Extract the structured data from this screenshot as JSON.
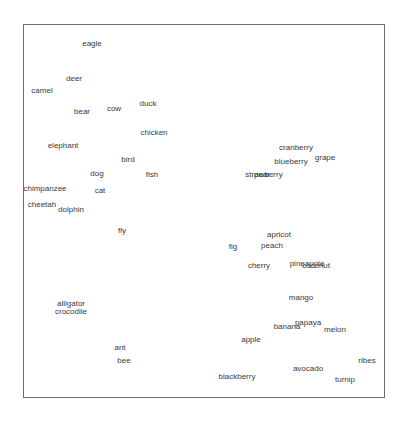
{
  "chart_data": {
    "type": "scatter",
    "title": "",
    "xlabel": "",
    "ylabel": "",
    "grid": false,
    "legend": null,
    "frame": {
      "left": 23,
      "top": 24,
      "right": 385,
      "bottom": 398
    },
    "style": {
      "text_color": "#3a3a3a",
      "frame_color": "#6e6e6e",
      "background": "#ffffff"
    },
    "note": "Text-label scatter (2D embedding); coordinates are pixel positions of label centers in the 407x423 image.",
    "points": [
      {
        "label": "eagle",
        "x": 92,
        "y": 44
      },
      {
        "label": "deer",
        "x": 74,
        "y": 79
      },
      {
        "label": "camel",
        "x": 42,
        "y": 91
      },
      {
        "label": "bear",
        "x": 82,
        "y": 112
      },
      {
        "label": "cow",
        "x": 114,
        "y": 109
      },
      {
        "label": "duck",
        "x": 148,
        "y": 104
      },
      {
        "label": "chicken",
        "x": 154,
        "y": 133
      },
      {
        "label": "elephant",
        "x": 63,
        "y": 146
      },
      {
        "label": "bird",
        "x": 128,
        "y": 160
      },
      {
        "label": "dog",
        "x": 97,
        "y": 174
      },
      {
        "label": "fish",
        "x": 152,
        "y": 175
      },
      {
        "label": "chimpanzee",
        "x": 45,
        "y": 189
      },
      {
        "label": "cat",
        "x": 100,
        "y": 191
      },
      {
        "label": "cheetah",
        "x": 42,
        "y": 205
      },
      {
        "label": "dolphin",
        "x": 71,
        "y": 210
      },
      {
        "label": "fly",
        "x": 122,
        "y": 231
      },
      {
        "label": "alligator",
        "x": 71,
        "y": 304
      },
      {
        "label": "crocodile",
        "x": 71,
        "y": 312
      },
      {
        "label": "ant",
        "x": 120,
        "y": 348
      },
      {
        "label": "bee",
        "x": 124,
        "y": 361
      },
      {
        "label": "cranberry",
        "x": 296,
        "y": 148
      },
      {
        "label": "grape",
        "x": 325,
        "y": 158
      },
      {
        "label": "blueberry",
        "x": 291,
        "y": 162
      },
      {
        "label": "strawberry",
        "x": 264,
        "y": 175
      },
      {
        "label": "pear",
        "x": 262,
        "y": 175
      },
      {
        "label": "apricot",
        "x": 279,
        "y": 235
      },
      {
        "label": "fig",
        "x": 233,
        "y": 247
      },
      {
        "label": "peach",
        "x": 272,
        "y": 246
      },
      {
        "label": "cherry",
        "x": 259,
        "y": 266
      },
      {
        "label": "pineapple",
        "x": 307,
        "y": 264
      },
      {
        "label": "coconut",
        "x": 316,
        "y": 266
      },
      {
        "label": "mango",
        "x": 301,
        "y": 298
      },
      {
        "label": "papaya",
        "x": 308,
        "y": 323
      },
      {
        "label": "banana",
        "x": 287,
        "y": 327
      },
      {
        "label": "melon",
        "x": 335,
        "y": 330
      },
      {
        "label": "apple",
        "x": 251,
        "y": 340
      },
      {
        "label": "ribes",
        "x": 367,
        "y": 361
      },
      {
        "label": "avocado",
        "x": 308,
        "y": 369
      },
      {
        "label": "blackberry",
        "x": 237,
        "y": 377
      },
      {
        "label": "turnip",
        "x": 345,
        "y": 380
      }
    ]
  }
}
